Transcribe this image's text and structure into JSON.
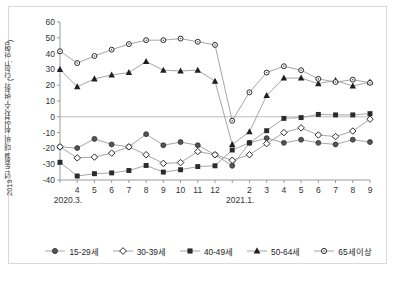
{
  "chart_data": {
    "type": "line",
    "title": "",
    "xlabel": "",
    "ylabel": "2019년 동월 대비 취업자수 변화 (단위: 만명)",
    "ylim": [
      -40,
      60
    ],
    "yticks": [
      60,
      50,
      40,
      30,
      20,
      10,
      0,
      -10,
      -20,
      -30,
      -40
    ],
    "grid": false,
    "legend_position": "bottom",
    "categories": [
      "3",
      "4",
      "5",
      "6",
      "7",
      "8",
      "9",
      "10",
      "11",
      "12",
      "1",
      "2",
      "3",
      "4",
      "5",
      "6",
      "7",
      "8",
      "9"
    ],
    "x_group_labels": [
      "2020.3.",
      "2021.1."
    ],
    "x_group_positions": [
      0,
      10
    ],
    "series": [
      {
        "name": "15-29세",
        "marker": "filled-circle",
        "values": [
          -19.0,
          -19.8,
          -14.0,
          -17.5,
          -19.0,
          -11.0,
          -18.0,
          -16.0,
          -18.0,
          -24.0,
          -31.0,
          -16.5,
          -13.5,
          -16.5,
          -14.5,
          -16.5,
          -17.5,
          -14.5,
          -16.0
        ]
      },
      {
        "name": "30-39세",
        "marker": "open-diamond",
        "values": [
          -19.0,
          -26.0,
          -25.5,
          -23.0,
          -19.0,
          -24.0,
          -29.5,
          -29.0,
          -22.0,
          -24.0,
          -27.5,
          -24.0,
          -17.0,
          -10.0,
          -7.0,
          -11.5,
          -12.5,
          -9.0,
          -1.5
        ]
      },
      {
        "name": "40-49세",
        "marker": "filled-square",
        "values": [
          -28.8,
          -37.5,
          -36.0,
          -35.5,
          -34.0,
          -30.8,
          -35.0,
          -33.5,
          -31.5,
          -31.0,
          -21.0,
          -16.5,
          -8.8,
          -1.0,
          -0.5,
          1.5,
          1.2,
          1.2,
          2.0
        ]
      },
      {
        "name": "50-64세",
        "marker": "filled-triangle",
        "values": [
          30.0,
          19.0,
          24.0,
          26.5,
          28.0,
          35.0,
          29.5,
          29.0,
          29.5,
          22.5,
          -17.5,
          -9.5,
          13.5,
          24.5,
          24.5,
          21.0,
          23.0,
          19.5,
          22.0
        ]
      },
      {
        "name": "65세이상",
        "marker": "open-circle",
        "values": [
          41.5,
          34.0,
          38.5,
          42.5,
          46.0,
          48.5,
          48.5,
          49.5,
          47.5,
          45.5,
          -2.5,
          15.5,
          28.0,
          32.0,
          29.5,
          24.0,
          22.0,
          23.5,
          21.5
        ]
      }
    ]
  },
  "legend": {
    "items": [
      {
        "label": "15-29세",
        "marker": "filled-circle"
      },
      {
        "label": "30-39세",
        "marker": "open-diamond"
      },
      {
        "label": "40-49세",
        "marker": "filled-square"
      },
      {
        "label": "50-64세",
        "marker": "filled-triangle"
      },
      {
        "label": "65세이상",
        "marker": "open-circle"
      }
    ]
  },
  "caption": "",
  "colors": {
    "line": "#9b9b9b",
    "marker": "#2b2b2b",
    "axis": "#9a9a9a",
    "text": "#333333",
    "frame": "#d9d9d9"
  }
}
